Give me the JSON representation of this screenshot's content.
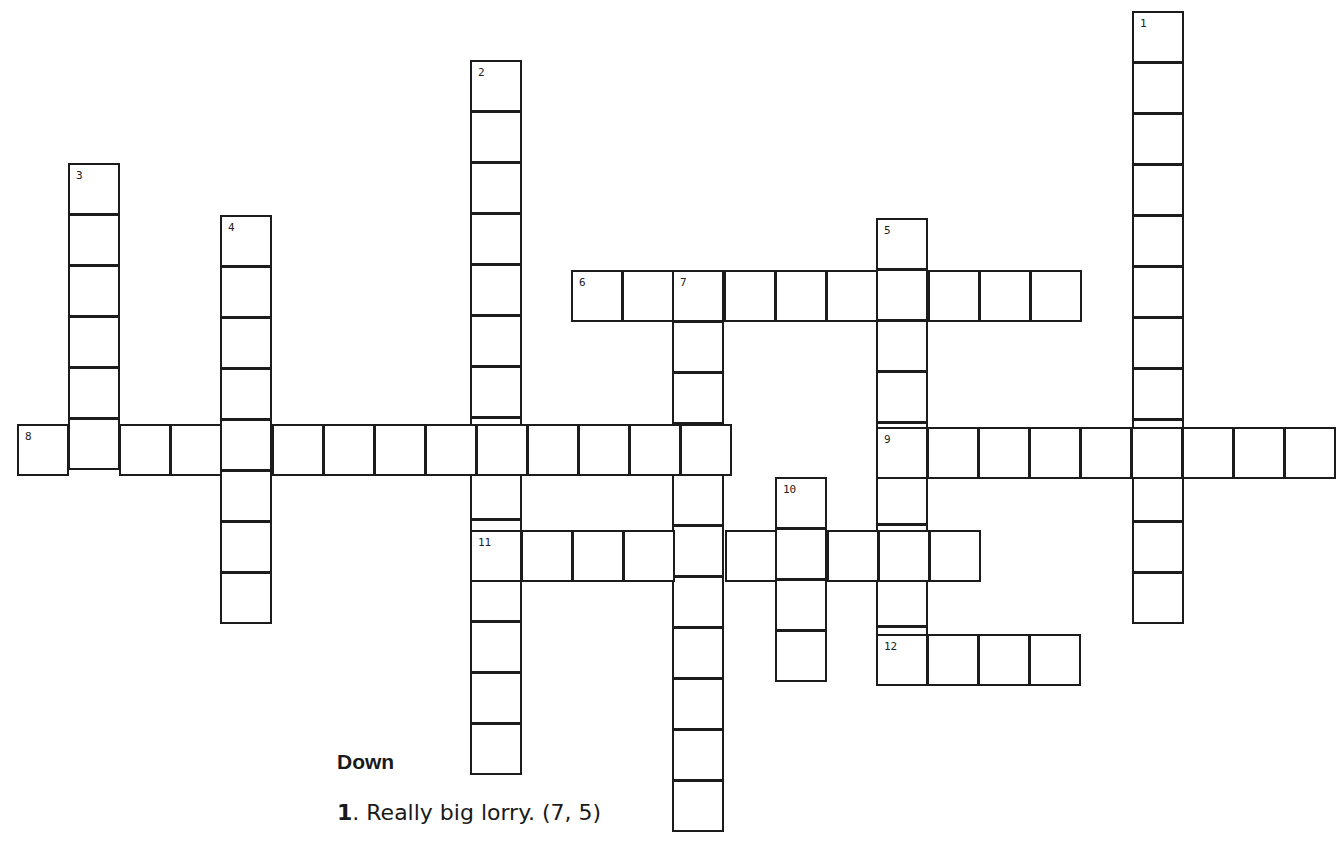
{
  "puzzle": {
    "cell_size": 51,
    "entries": [
      {
        "number": "1",
        "direction": "down",
        "x": 1132,
        "y": 11,
        "length": 12
      },
      {
        "number": "2",
        "direction": "down",
        "x": 470,
        "y": 60,
        "length": 14
      },
      {
        "number": "3",
        "direction": "down",
        "x": 68,
        "y": 163,
        "length": 6
      },
      {
        "number": "4",
        "direction": "down",
        "x": 220,
        "y": 215,
        "length": 8
      },
      {
        "number": "5",
        "direction": "down",
        "x": 876,
        "y": 218,
        "length": 9
      },
      {
        "number": "6",
        "direction": "across",
        "x": 571,
        "y": 270,
        "length": 10
      },
      {
        "number": "7",
        "direction": "down",
        "x": 672,
        "y": 270,
        "length": 11
      },
      {
        "number": "8",
        "direction": "across",
        "x": 17,
        "y": 424,
        "length": 14
      },
      {
        "number": "9",
        "direction": "across",
        "x": 876,
        "y": 427,
        "length": 9
      },
      {
        "number": "10",
        "direction": "down",
        "x": 775,
        "y": 477,
        "length": 4
      },
      {
        "number": "11",
        "direction": "across",
        "x": 470,
        "y": 530,
        "length": 10
      },
      {
        "number": "12",
        "direction": "across",
        "x": 876,
        "y": 634,
        "length": 4
      }
    ]
  },
  "clues": {
    "down_heading": "Down",
    "down": [
      {
        "number": "1",
        "text": ". Really big lorry. (7, 5)"
      }
    ]
  }
}
